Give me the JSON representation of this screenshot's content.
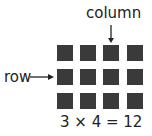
{
  "labels": {
    "column": "column",
    "row": "row"
  },
  "equation": "3 × 4 = 12",
  "grid": {
    "rows": 3,
    "columns": 4,
    "square_color": "#3a3a3a"
  }
}
